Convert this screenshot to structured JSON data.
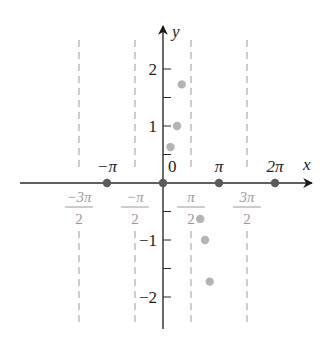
{
  "title": "",
  "colors": {
    "axis": "#2a2a2a",
    "asymptote": "#9a9a9a",
    "axis_point": "#5a5a5a",
    "plot_point": "#b4b4b4",
    "asymptote_label": "#9a9a9a",
    "label": "#222222"
  },
  "axes": {
    "x_label": "x",
    "y_label": "y",
    "origin_label": "0",
    "x_ticks": [
      {
        "label": "−π",
        "value": -3.14159
      },
      {
        "label": "π",
        "value": 3.14159
      },
      {
        "label": "2π",
        "value": 6.28319
      }
    ],
    "y_ticks": [
      {
        "label": "2",
        "value": 2
      },
      {
        "label": "1",
        "value": 1
      },
      {
        "label": "−1",
        "value": -1
      },
      {
        "label": "−2",
        "value": -2
      }
    ],
    "asymptotes": [
      {
        "num": "−3π",
        "den": "2",
        "value": -4.71239
      },
      {
        "num": "−π",
        "den": "2",
        "value": -1.5708
      },
      {
        "num": "π",
        "den": "2",
        "value": 1.5708
      },
      {
        "num": "3π",
        "den": "2",
        "value": 4.71239
      }
    ]
  },
  "chart_data": {
    "type": "scatter",
    "title": "",
    "xlabel": "x",
    "ylabel": "y",
    "xlim": [
      -5.8,
      7.0
    ],
    "ylim": [
      -2.6,
      2.8
    ],
    "grid": false,
    "x_tick_labels": [
      "−π",
      "0",
      "π",
      "2π"
    ],
    "y_tick_labels": [
      "−2",
      "−1",
      "1",
      "2"
    ],
    "vertical_asymptotes": [
      "−3π/2",
      "−π/2",
      "π/2",
      "3π/2"
    ],
    "series": [
      {
        "name": "zeros on x-axis",
        "x": [
          -3.14159,
          0,
          3.14159,
          6.28319
        ],
        "y": [
          0,
          0,
          0,
          0
        ]
      },
      {
        "name": "plotted points",
        "x": [
          0.42,
          0.79,
          1.05,
          2.09,
          2.36,
          2.62
        ],
        "y": [
          0.63,
          1.0,
          1.73,
          -0.63,
          -1.0,
          -1.73
        ]
      }
    ]
  }
}
